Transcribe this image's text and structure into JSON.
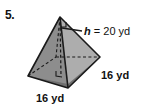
{
  "figure": {
    "problem_number": "5.",
    "shape": "square-pyramid",
    "background_color": "#ffffff",
    "outline_color": "#1a1a1a",
    "faces": {
      "left_front_color": "#8d8d8d",
      "right_front_color": "#a8a8a8",
      "base_front_color": "#6f6f6f",
      "back_hidden_color": "#9a9a9a"
    },
    "labels": {
      "height": {
        "variable": "h",
        "equals": "=",
        "value": "20",
        "unit": "yd",
        "full": "h = 20 yd"
      },
      "side_right": {
        "value": "16",
        "unit": "yd",
        "full": "16 yd"
      },
      "side_bottom": {
        "value": "16",
        "unit": "yd",
        "full": "16 yd"
      }
    },
    "annotations": {
      "apex_right_angle": "right-angle-marker",
      "base_right_angle": "right-angle-marker",
      "hidden_edges": "dashed",
      "leader_line": "solid"
    }
  }
}
